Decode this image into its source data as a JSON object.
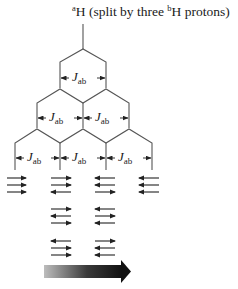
{
  "title": {
    "prefix_sup": "a",
    "main": "H (split by three ",
    "mid_sup": "b",
    "suffix": "H protons)"
  },
  "coupling_label": {
    "symbol": "J",
    "subscript": "ab"
  },
  "tree": {
    "levels": 3,
    "final_lines": 4,
    "intensity_ratio": [
      1,
      3,
      3,
      1
    ]
  },
  "spin_states": [
    {
      "line": 1,
      "configurations": [
        [
          "right",
          "right",
          "right"
        ]
      ]
    },
    {
      "line": 2,
      "configurations": [
        [
          "right",
          "right",
          "left"
        ],
        [
          "right",
          "left",
          "right"
        ],
        [
          "left",
          "right",
          "right"
        ]
      ]
    },
    {
      "line": 3,
      "configurations": [
        [
          "left",
          "left",
          "right"
        ],
        [
          "left",
          "right",
          "left"
        ],
        [
          "right",
          "left",
          "left"
        ]
      ]
    },
    {
      "line": 4,
      "configurations": [
        [
          "left",
          "left",
          "left"
        ]
      ]
    }
  ],
  "colors": {
    "line": "#555555",
    "arrow": "#222222",
    "gradient_start": "#bbbbbb",
    "gradient_end": "#111111"
  }
}
